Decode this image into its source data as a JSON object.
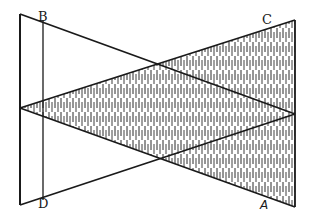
{
  "diagram": {
    "type": "geometric-figure",
    "stroke_color": "#1a1a1a",
    "hatch_color": "#2a2a2a",
    "background": "#ffffff",
    "points": {
      "outer_top_left": [
        20,
        14
      ],
      "outer_bottom_left": [
        20,
        205
      ],
      "left_apex": [
        20,
        108
      ],
      "C": [
        295,
        20
      ],
      "A_corner": [
        295,
        207
      ],
      "right_apex": [
        295,
        114
      ],
      "B": [
        43,
        20
      ],
      "D": [
        43,
        200
      ]
    },
    "labels": {
      "B": "B",
      "C": "C",
      "D": "D",
      "A": "A"
    },
    "shaded_region": [
      "left_apex",
      "C",
      "A_corner"
    ]
  }
}
